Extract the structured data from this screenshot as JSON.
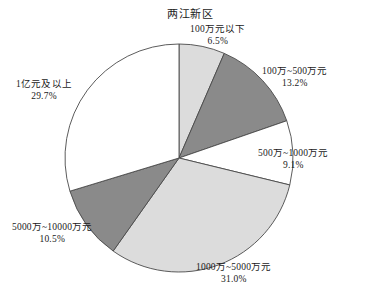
{
  "chart_data": {
    "type": "pie",
    "title": "两江新区",
    "xlabel": "",
    "ylabel": "",
    "legend": "none",
    "grid": false,
    "start_angle_deg": 0,
    "direction": "clockwise",
    "categories": [
      "100万元以下",
      "100万~500万元",
      "500万~1000万元",
      "1000万~5000万元",
      "5000万~10000万元",
      "1亿元及以上"
    ],
    "values": [
      6.5,
      13.2,
      9.1,
      31.0,
      10.5,
      29.7
    ],
    "value_labels": [
      "6.5%",
      "13.2%",
      "9.1%",
      "31.0%",
      "10.5%",
      "29.7%"
    ],
    "colors": [
      "#dcdcdc",
      "#8a8a8a",
      "#ffffff",
      "#dcdcdc",
      "#8a8a8a",
      "#ffffff"
    ],
    "slices": [
      {
        "label": "100万元以下",
        "percent_text": "6.5%",
        "value": 6.5,
        "color": "#dcdcdc"
      },
      {
        "label": "100万~500万元",
        "percent_text": "13.2%",
        "value": 13.2,
        "color": "#8a8a8a"
      },
      {
        "label": "500万~1000万元",
        "percent_text": "9.1%",
        "value": 9.1,
        "color": "#ffffff"
      },
      {
        "label": "1000万~5000万元",
        "percent_text": "31.0%",
        "value": 31.0,
        "color": "#dcdcdc"
      },
      {
        "label": "5000万~10000万元",
        "percent_text": "10.5%",
        "value": 10.5,
        "color": "#8a8a8a"
      },
      {
        "label": "1亿元及以上",
        "percent_text": "29.7%",
        "value": 29.7,
        "color": "#ffffff"
      }
    ],
    "outline_color": "#4a4a4a",
    "background": "#ffffff"
  }
}
